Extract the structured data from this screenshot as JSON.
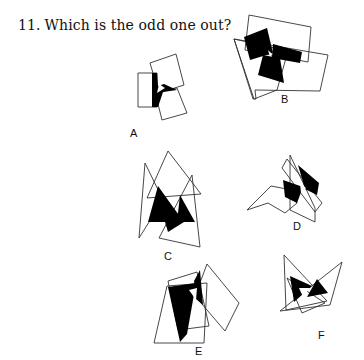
{
  "question": {
    "number": "11.",
    "text": "Which is the odd one out?"
  },
  "options": [
    {
      "label": "A",
      "x": 130,
      "y": 127
    },
    {
      "label": "B",
      "x": 281,
      "y": 93
    },
    {
      "label": "C",
      "x": 164,
      "y": 250
    },
    {
      "label": "D",
      "x": 293,
      "y": 220
    },
    {
      "label": "E",
      "x": 195,
      "y": 345
    },
    {
      "label": "F",
      "x": 318,
      "y": 329
    }
  ],
  "colors": {
    "stroke": "#333333",
    "fill": "#000000",
    "background": "#ffffff"
  }
}
